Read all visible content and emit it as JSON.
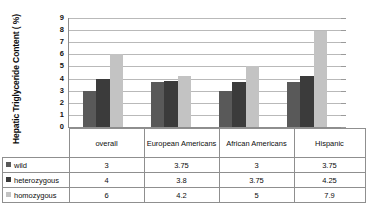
{
  "chart_data": {
    "type": "bar",
    "title": "",
    "xlabel": "",
    "ylabel": "Hepatic Triglyceride Content ( %)",
    "ylim": [
      0,
      9
    ],
    "yticks": [
      0,
      1,
      2,
      3,
      4,
      5,
      6,
      7,
      8,
      9
    ],
    "grid": true,
    "legend_position": "table-below",
    "categories": [
      "overall",
      "European Americans",
      "African Americans",
      "Hispanic"
    ],
    "series": [
      {
        "name": "wild",
        "color": "#595959",
        "values": [
          3,
          3.75,
          3,
          3.75
        ]
      },
      {
        "name": "heterozygous",
        "color": "#3b3b3b",
        "values": [
          4,
          3.8,
          3.75,
          4.25
        ]
      },
      {
        "name": "homozygous",
        "color": "#c3c3c3",
        "values": [
          6,
          4.2,
          5,
          7.9
        ]
      }
    ]
  },
  "axis": {
    "y_title": "Hepatic Triglyceride Content ( %)",
    "tick_labels": [
      "9",
      "8",
      "7",
      "6",
      "5",
      "4",
      "3",
      "2",
      "1",
      "0"
    ]
  },
  "table": {
    "column_headers": [
      "",
      "overall",
      "European Americans",
      "African Americans",
      "Hispanic"
    ],
    "rows": [
      {
        "label": "wild",
        "swatch": "wild-swatch",
        "values": [
          "3",
          "3.75",
          "3",
          "3.75"
        ]
      },
      {
        "label": "heterozygous",
        "swatch": "heterozygous-swatch",
        "values": [
          "4",
          "3.8",
          "3.75",
          "4.25"
        ]
      },
      {
        "label": "homozygous",
        "swatch": "homozygous-swatch",
        "values": [
          "6",
          "4.2",
          "5",
          "7.9"
        ]
      }
    ]
  }
}
